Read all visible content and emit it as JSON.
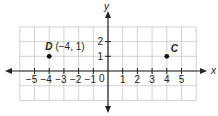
{
  "chart_data": {
    "type": "scatter",
    "title": "",
    "xlabel": "x",
    "ylabel": "y",
    "xlim": [
      -6,
      6
    ],
    "ylim": [
      -2,
      3
    ],
    "grid": true,
    "origin_label": "0",
    "x_ticks": [
      "−5",
      "−4",
      "−3",
      "−2",
      "−1",
      "1",
      "2",
      "3",
      "4",
      "5"
    ],
    "x_tick_values": [
      -5,
      -4,
      -3,
      -2,
      -1,
      1,
      2,
      3,
      4,
      5
    ],
    "y_ticks": [
      "1",
      "2"
    ],
    "y_tick_values": [
      1,
      2
    ],
    "points": [
      {
        "name": "D",
        "x": -4,
        "y": 1,
        "label": "D",
        "coord_label": "(−4, 1)"
      },
      {
        "name": "C",
        "x": 4,
        "y": 1,
        "label": "C",
        "coord_label": ""
      }
    ]
  },
  "colors": {
    "grid": "#c8c8c8",
    "axis": "#222222",
    "point": "#111111",
    "background": "#ffffff"
  }
}
